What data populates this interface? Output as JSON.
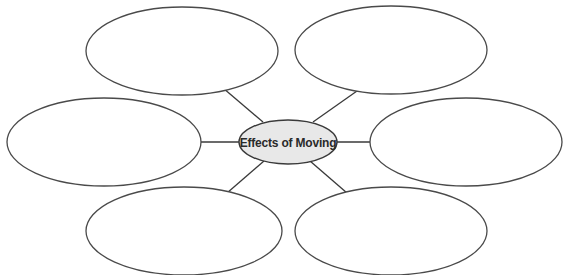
{
  "diagram": {
    "type": "web-organizer",
    "center": {
      "label": "Effects of Moving",
      "cx": 288,
      "cy": 142,
      "rx": 49,
      "ry": 22,
      "fill": "#e8e8e8"
    },
    "outer_bubbles": [
      {
        "id": "top-left",
        "label": "",
        "cx": 182,
        "cy": 51,
        "rx": 96,
        "ry": 44
      },
      {
        "id": "top-right",
        "label": "",
        "cx": 391,
        "cy": 50,
        "rx": 96,
        "ry": 44
      },
      {
        "id": "left",
        "label": "",
        "cx": 104,
        "cy": 142,
        "rx": 97,
        "ry": 44
      },
      {
        "id": "right",
        "label": "",
        "cx": 466,
        "cy": 142,
        "rx": 96,
        "ry": 44
      },
      {
        "id": "bottom-left",
        "label": "",
        "cx": 184,
        "cy": 231,
        "rx": 98,
        "ry": 44
      },
      {
        "id": "bottom-right",
        "label": "",
        "cx": 391,
        "cy": 231,
        "rx": 96,
        "ry": 44
      }
    ],
    "connectors": [
      {
        "from": "center",
        "to": "top-left"
      },
      {
        "from": "center",
        "to": "top-right"
      },
      {
        "from": "center",
        "to": "left"
      },
      {
        "from": "center",
        "to": "right"
      },
      {
        "from": "center",
        "to": "bottom-left"
      },
      {
        "from": "center",
        "to": "bottom-right"
      }
    ],
    "stroke_color": "#3a3a3a"
  }
}
